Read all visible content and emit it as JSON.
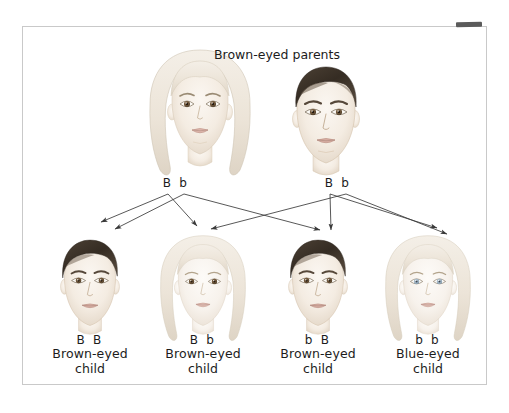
{
  "figure": {
    "title": "Brown-eyed parents",
    "topic": "Mendelian inheritance of eye color"
  },
  "parents": [
    {
      "id": "mother",
      "genotype": "B b",
      "hair": "blonde",
      "eye_color": "brown",
      "sex": "female"
    },
    {
      "id": "father",
      "genotype": "B b",
      "hair": "dark-brown",
      "eye_color": "brown",
      "sex": "male"
    }
  ],
  "children": [
    {
      "id": "child-1",
      "genotype": "B B",
      "caption": "Brown-eyed\nchild",
      "phenotype": "Brown-eyed",
      "hair": "dark-brown",
      "eye_color": "brown",
      "sex": "male"
    },
    {
      "id": "child-2",
      "genotype": "B b",
      "caption": "Brown-eyed\nchild",
      "phenotype": "Brown-eyed",
      "hair": "blonde",
      "eye_color": "brown",
      "sex": "female"
    },
    {
      "id": "child-3",
      "genotype": "b B",
      "caption": "Brown-eyed\nchild",
      "phenotype": "Brown-eyed",
      "hair": "dark-brown",
      "eye_color": "brown",
      "sex": "male"
    },
    {
      "id": "child-4",
      "genotype": "b b",
      "caption": "Blue-eyed\nchild",
      "phenotype": "Blue-eyed",
      "hair": "blonde",
      "eye_color": "blue",
      "sex": "female"
    }
  ],
  "colors": {
    "frame_border": "#c9c9c9",
    "text": "#1c1c1c",
    "arrow": "#3a3a3a",
    "dark_hair": "#3b3128",
    "blonde_hair": "#ece6dc",
    "skin": "#f6f0e9",
    "brown_eye": "#6b5338",
    "blue_eye": "#9fb4c4",
    "background": "#ffffff"
  }
}
